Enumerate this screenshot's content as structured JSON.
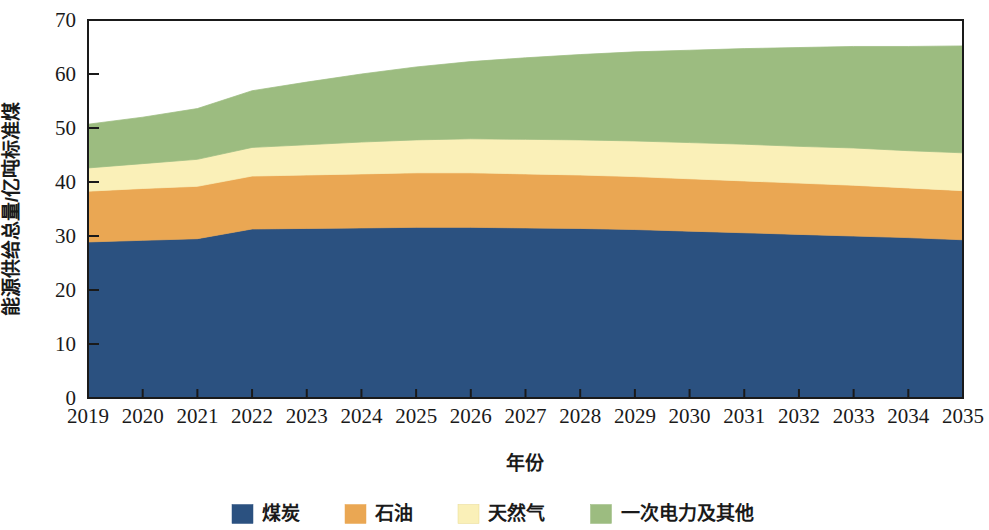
{
  "chart_data": {
    "type": "area",
    "stacked": true,
    "title": "",
    "xlabel": "年份",
    "ylabel": "能源供给总量/亿吨标准煤",
    "categories": [
      2019,
      2020,
      2021,
      2022,
      2023,
      2024,
      2025,
      2026,
      2027,
      2028,
      2029,
      2030,
      2031,
      2032,
      2033,
      2034,
      2035
    ],
    "xlim": [
      2019,
      2035
    ],
    "ylim": [
      0,
      70
    ],
    "yticks": [
      0,
      10,
      20,
      30,
      40,
      50,
      60,
      70
    ],
    "ytick_labels": [
      "0",
      "10",
      "20",
      "30",
      "40",
      "50",
      "60",
      "70"
    ],
    "xtick_labels": [
      "2019",
      "2020",
      "2021",
      "2022",
      "2023",
      "2024",
      "2025",
      "2026",
      "2027",
      "2028",
      "2029",
      "2030",
      "2031",
      "2032",
      "2033",
      "2034",
      "2035"
    ],
    "grid": false,
    "legend_position": "bottom",
    "series": [
      {
        "name": "煤炭",
        "color": "#2b5180",
        "values": [
          28.9,
          29.2,
          29.5,
          31.3,
          31.4,
          31.5,
          31.6,
          31.6,
          31.5,
          31.4,
          31.2,
          30.9,
          30.6,
          30.3,
          30.0,
          29.7,
          29.3
        ]
      },
      {
        "name": "石油",
        "color": "#eaa753",
        "values": [
          9.4,
          9.6,
          9.7,
          9.8,
          9.9,
          10.0,
          10.1,
          10.1,
          10.0,
          9.9,
          9.8,
          9.7,
          9.6,
          9.5,
          9.4,
          9.2,
          9.1
        ]
      },
      {
        "name": "天然气",
        "color": "#faf0b8",
        "values": [
          4.3,
          4.6,
          5.0,
          5.3,
          5.6,
          5.9,
          6.1,
          6.3,
          6.4,
          6.5,
          6.6,
          6.7,
          6.8,
          6.8,
          6.9,
          6.9,
          7.0
        ]
      },
      {
        "name": "一次电力及其他",
        "color": "#9cbc80",
        "values": [
          8.1,
          8.6,
          9.4,
          10.5,
          11.6,
          12.6,
          13.5,
          14.3,
          15.1,
          15.8,
          16.5,
          17.1,
          17.7,
          18.3,
          18.8,
          19.3,
          19.8
        ]
      }
    ],
    "totals": [
      50.7,
      52.0,
      53.6,
      56.9,
      58.5,
      60.0,
      61.3,
      62.3,
      63.0,
      63.6,
      64.1,
      64.4,
      64.7,
      64.9,
      65.1,
      65.1,
      65.2
    ]
  },
  "legend": {
    "items": [
      {
        "label": "煤炭",
        "color": "#2b5180"
      },
      {
        "label": "石油",
        "color": "#eaa753"
      },
      {
        "label": "天然气",
        "color": "#faf0b8"
      },
      {
        "label": "一次电力及其他",
        "color": "#9cbc80"
      }
    ]
  },
  "axes": {
    "x_title": "年份",
    "y_title": "能源供给总量/亿吨标准煤"
  }
}
